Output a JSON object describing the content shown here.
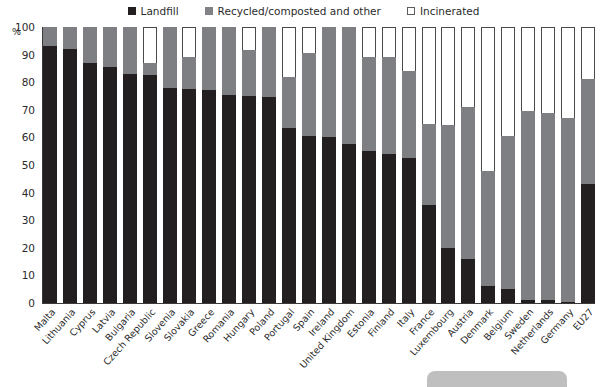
{
  "chart_data": {
    "type": "bar",
    "subtype": "stacked-bar-100-percent",
    "title": "",
    "xlabel": "",
    "ylabel": "%",
    "ylim": [
      0,
      100
    ],
    "yticks": [
      0,
      10,
      20,
      30,
      40,
      50,
      60,
      70,
      80,
      90,
      100
    ],
    "grid": false,
    "legend_position": "top-center",
    "categories": [
      "Malta",
      "Lithuania",
      "Cyprus",
      "Latvia",
      "Bulgaria",
      "Czech Republic",
      "Slovenia",
      "Slovakia",
      "Greece",
      "Romania",
      "Hungary",
      "Poland",
      "Portugal",
      "Spain",
      "Ireland",
      "United Kingdom",
      "Estonia",
      "Finland",
      "Italy",
      "France",
      "Luxembourg",
      "Austria",
      "Denmark",
      "Belgium",
      "Sweden",
      "Netherlands",
      "Germany",
      "EU27"
    ],
    "series": [
      {
        "name": "Landfill",
        "color": "#231f20",
        "values": [
          93,
          92,
          87,
          85.5,
          83,
          82.5,
          78,
          77.5,
          77,
          75.5,
          75,
          74.5,
          63.5,
          60.5,
          60,
          57.5,
          55,
          54,
          52.5,
          35.5,
          20,
          16,
          6,
          5,
          1,
          1,
          0.5,
          43
        ]
      },
      {
        "name": "Recycled/composted and other",
        "color": "#7d7f82",
        "values": [
          7,
          8,
          13,
          14.5,
          17,
          4.5,
          22,
          11.5,
          23,
          24.5,
          16.5,
          25.5,
          18.5,
          30,
          40,
          42.5,
          34,
          35,
          31.5,
          29.5,
          44.5,
          55,
          42,
          55.5,
          68.5,
          68,
          66.5,
          38
        ]
      },
      {
        "name": "Incinerated",
        "color": "#ffffff",
        "values": [
          0,
          0,
          0,
          0,
          0,
          13,
          0,
          11,
          0,
          0,
          8.5,
          0,
          18,
          9.5,
          0,
          0,
          11,
          11,
          16,
          35,
          35.5,
          29,
          52,
          39.5,
          30.5,
          31,
          33,
          19
        ]
      }
    ]
  },
  "legend": {
    "items": [
      {
        "label": "Landfill",
        "swatch": "filled-dark-square-icon"
      },
      {
        "label": "Recycled/composted and other",
        "swatch": "filled-grey-square-icon"
      },
      {
        "label": "Incinerated",
        "swatch": "outlined-white-square-icon"
      }
    ]
  },
  "axes": {
    "y_unit_label": "%",
    "y_tick_labels": [
      "100",
      "90",
      "80",
      "70",
      "60",
      "50",
      "40",
      "30",
      "20",
      "10",
      "0"
    ]
  }
}
